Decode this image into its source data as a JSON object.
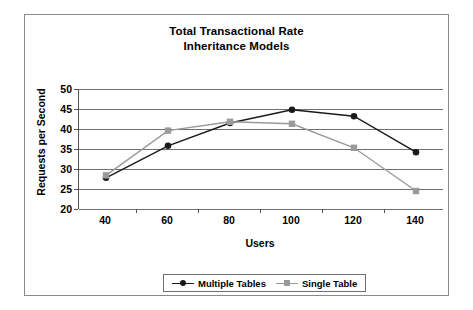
{
  "chart_data": {
    "type": "line",
    "title": "Total Transactional Rate",
    "subtitle": "Inheritance Models",
    "title_lines": [
      "Total Transactional Rate",
      "Inheritance Models"
    ],
    "xlabel": "Users",
    "ylabel": "Requests per Second",
    "x": [
      40,
      60,
      80,
      100,
      120,
      140
    ],
    "xtick_labels": [
      "40",
      "60",
      "80",
      "100",
      "120",
      "140"
    ],
    "ytick_labels": [
      "50",
      "45",
      "40",
      "35",
      "30",
      "25",
      "20"
    ],
    "yticks": [
      50,
      45,
      40,
      35,
      30,
      25,
      20
    ],
    "ylim": [
      20,
      50
    ],
    "grid": "horizontal",
    "legend_position": "bottom-outside",
    "series": [
      {
        "name": "Multiple Tables",
        "color": "#1a1a1a",
        "marker": "circle",
        "values": [
          27.8,
          35.8,
          41.5,
          44.8,
          43.2,
          34.2
        ]
      },
      {
        "name": "Single Table",
        "color": "#9a9a9a",
        "marker": "square",
        "values": [
          28.4,
          39.6,
          41.8,
          41.3,
          35.3,
          24.5
        ]
      }
    ]
  },
  "figure": {
    "frame_color": "#8a8a8a",
    "background": "#ffffff",
    "grid_color": "#6f6f6f",
    "axis_color": "#555555"
  }
}
